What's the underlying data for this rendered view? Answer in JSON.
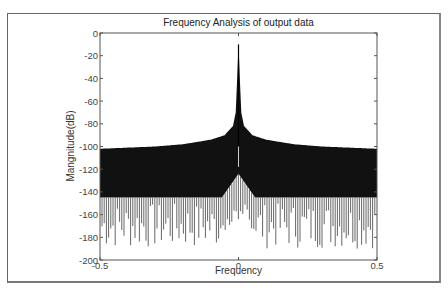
{
  "chart_data": {
    "type": "line",
    "title": "Frequency Analysis of output data",
    "xlabel": "Frequency",
    "ylabel": "Mangnitude(dB)",
    "xlim": [
      -0.5,
      0.5
    ],
    "ylim": [
      -200,
      0
    ],
    "x_ticks": [
      -0.5,
      0,
      0.5
    ],
    "x_tick_labels": [
      "-0.5",
      "0",
      "0.5"
    ],
    "y_ticks": [
      0,
      -20,
      -40,
      -60,
      -80,
      -100,
      -120,
      -140,
      -160,
      -180,
      -200
    ],
    "y_tick_labels": [
      "0",
      "-20",
      "-40",
      "-60",
      "-80",
      "-100",
      "-120",
      "-140",
      "-160",
      "-180",
      "-200"
    ],
    "grid": false,
    "legend": null,
    "series": [
      {
        "name": "Magnitude spectrum",
        "color": "#000000",
        "peak": {
          "x": 0,
          "y": -10
        },
        "upper_envelope": {
          "x": [
            -0.5,
            -0.4,
            -0.3,
            -0.2,
            -0.1,
            -0.05,
            -0.02,
            -0.01,
            0,
            0.01,
            0.02,
            0.05,
            0.1,
            0.2,
            0.3,
            0.4,
            0.5
          ],
          "y": [
            -102,
            -101,
            -100,
            -98,
            -94,
            -90,
            -82,
            -70,
            -10,
            -70,
            -82,
            -90,
            -94,
            -98,
            -100,
            -101,
            -102
          ]
        },
        "lower_dense_floor_dB": -145,
        "lower_spike_range_dB": [
          -190,
          -150
        ],
        "center_lower_peak_dB": -118
      }
    ]
  },
  "plot": {
    "title": "Frequency Analysis of output data",
    "xlabel": "Frequency",
    "ylabel": "Mangnitude(dB)"
  }
}
